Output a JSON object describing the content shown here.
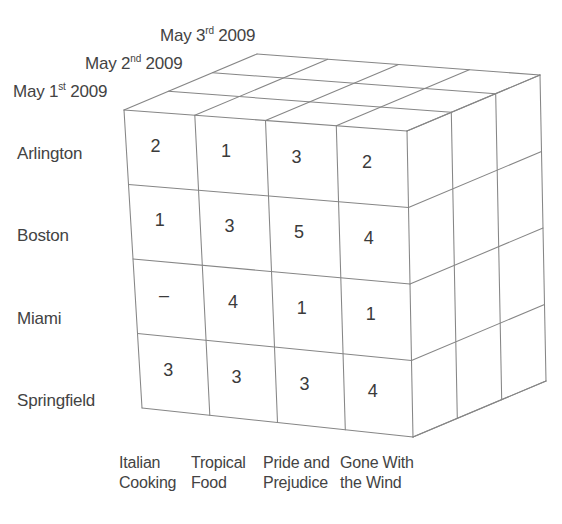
{
  "figure": {
    "line_color": "#7c7c7c",
    "text_color": "#434343",
    "background": "#ffffff"
  },
  "chart_data": {
    "type": "heatmap",
    "title": "",
    "xlabel": "",
    "ylabel": "",
    "grid": true,
    "legend_position": "none",
    "dimensions": [
      "Book",
      "City",
      "Date"
    ],
    "x_axis_name": "Book",
    "y_axis_name": "City",
    "z_axis_name": "Date",
    "categories": [
      "Italian Cooking",
      "Tropical Food",
      "Pride and Prejudice",
      "Gone With the Wind"
    ],
    "rows": [
      "Arlington",
      "Boston",
      "Miami",
      "Springfield"
    ],
    "layers": [
      "May 1st 2009",
      "May 2nd 2009",
      "May 3rd 2009"
    ],
    "visible_layer": "May 1st 2009",
    "values": [
      [
        2,
        1,
        3,
        2
      ],
      [
        1,
        3,
        5,
        4
      ],
      [
        "–",
        4,
        1,
        1
      ],
      [
        3,
        3,
        3,
        4
      ]
    ],
    "note": "Front face shows the May 1st 2009 slice; dash denotes no value."
  },
  "dates": {
    "items": [
      {
        "month": "May ",
        "ordinal_num": "3",
        "ordinal_suffix": "rd",
        "year": " 2009",
        "full": "May 3rd 2009"
      },
      {
        "month": "May ",
        "ordinal_num": "2",
        "ordinal_suffix": "nd",
        "year": " 2009",
        "full": "May 2nd 2009"
      },
      {
        "month": "May ",
        "ordinal_num": "1",
        "ordinal_suffix": "st",
        "year": " 2009",
        "full": "May 1st 2009"
      }
    ]
  },
  "cities": {
    "items": [
      {
        "label": "Arlington"
      },
      {
        "label": "Boston"
      },
      {
        "label": "Miami"
      },
      {
        "label": "Springfield"
      }
    ]
  },
  "books": {
    "items": [
      {
        "line1": "Italian",
        "line2": "Cooking",
        "full": "Italian Cooking"
      },
      {
        "line1": "Tropical",
        "line2": "Food",
        "full": "Tropical Food"
      },
      {
        "line1": "Pride and",
        "line2": "Prejudice",
        "full": "Pride and Prejudice"
      },
      {
        "line1": "Gone With",
        "line2": "the Wind",
        "full": "Gone With the Wind"
      }
    ]
  },
  "cells": {
    "r0": [
      {
        "value": "2"
      },
      {
        "value": "1"
      },
      {
        "value": "3"
      },
      {
        "value": "2"
      }
    ],
    "r1": [
      {
        "value": "1"
      },
      {
        "value": "3"
      },
      {
        "value": "5"
      },
      {
        "value": "4"
      }
    ],
    "r2": [
      {
        "value": "–"
      },
      {
        "value": "4"
      },
      {
        "value": "1"
      },
      {
        "value": "1"
      }
    ],
    "r3": [
      {
        "value": "3"
      },
      {
        "value": "3"
      },
      {
        "value": "3"
      },
      {
        "value": "4"
      }
    ]
  }
}
